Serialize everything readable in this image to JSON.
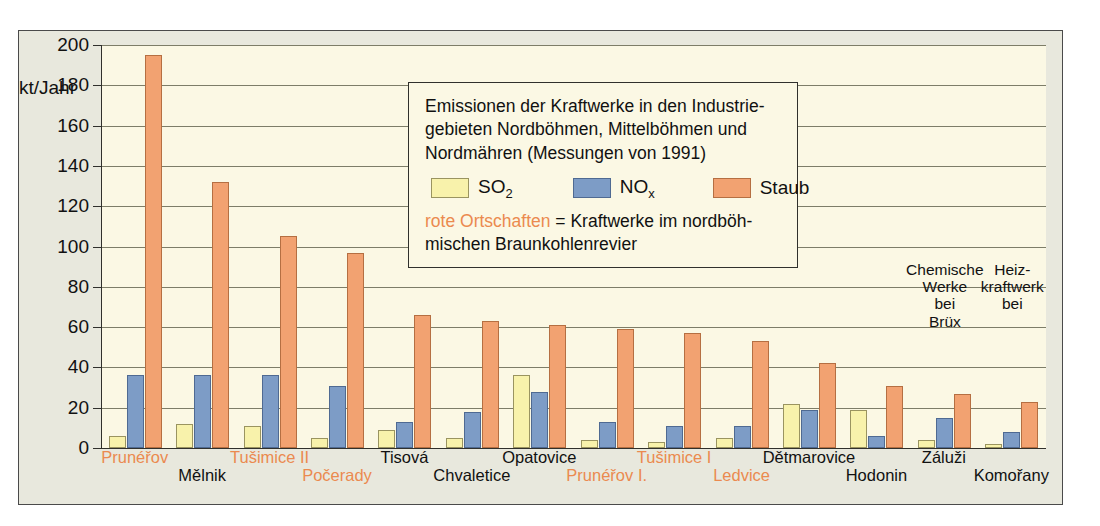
{
  "chart_data": {
    "type": "bar",
    "xlabel": "",
    "ylabel": "kt/Jahr",
    "ylim": [
      0,
      200
    ],
    "yticks": [
      0,
      20,
      40,
      60,
      80,
      100,
      120,
      140,
      160,
      180,
      200
    ],
    "grid": true,
    "legend_position": "inside-top-center",
    "categories": [
      "Prunéřov",
      "Mělnik",
      "Tušimice II",
      "Počerady",
      "Tisová",
      "Chvaletice",
      "Opatovice",
      "Prunéřov I.",
      "Tušimice I",
      "Ledvice",
      "Dětmarovice",
      "Hodonin",
      "Záluži",
      "Komořany"
    ],
    "series": [
      {
        "name": "SO2",
        "color": "#f8f2ab",
        "values": [
          6,
          12,
          11,
          5,
          9,
          5,
          36,
          4,
          3,
          5,
          22,
          19,
          4,
          2
        ]
      },
      {
        "name": "NOx",
        "color": "#7d9cc6",
        "values": [
          36,
          36,
          36,
          31,
          13,
          18,
          28,
          13,
          11,
          11,
          19,
          6,
          15,
          8
        ]
      },
      {
        "name": "Staub",
        "color": "#f2a271",
        "values": [
          195,
          132,
          105,
          97,
          66,
          63,
          61,
          59,
          57,
          53,
          42,
          31,
          27,
          23
        ]
      }
    ],
    "highlighted_categories": [
      "Prunéřov",
      "Tušimice II",
      "Počerady",
      "Prunéřov I.",
      "Tušimice I",
      "Ledvice"
    ],
    "annotations": [
      {
        "text": "Chemische\nWerke\nbei\nBrüx",
        "category": "Záluži"
      },
      {
        "text": "Heiz-\nkraftwerk\nbei",
        "category": "Komořany"
      }
    ]
  },
  "axis": {
    "unit_label": "kt/Jahr",
    "tick_labels": [
      "200",
      "180",
      "160",
      "140",
      "120",
      "100",
      "80",
      "60",
      "40",
      "20",
      "0"
    ]
  },
  "legend": {
    "line1": "Emissionen der Kraftwerke in den Industrie-",
    "line2": "gebieten Nordböhmen, Mittelböhmen und",
    "line3": "Nordmähren (Messungen von 1991)",
    "keys": [
      {
        "label": "SO",
        "sub": "2",
        "name": "so2"
      },
      {
        "label": "NO",
        "sub": "x",
        "name": "nox"
      },
      {
        "label": "Staub",
        "sub": "",
        "name": "staub"
      }
    ],
    "note_red": "rote Ortschaften",
    "note_rest": " = Kraftwerke im nordböh-",
    "note_line2": "mischen Braunkohlenrevier"
  },
  "colors": {
    "so2": "#f8f2ab",
    "nox": "#7d9cc6",
    "staub": "#f2a271",
    "highlight": "#eb8a4f",
    "plot_bg": "#fbf8e4",
    "panel_bg": "#e8e8dd"
  }
}
